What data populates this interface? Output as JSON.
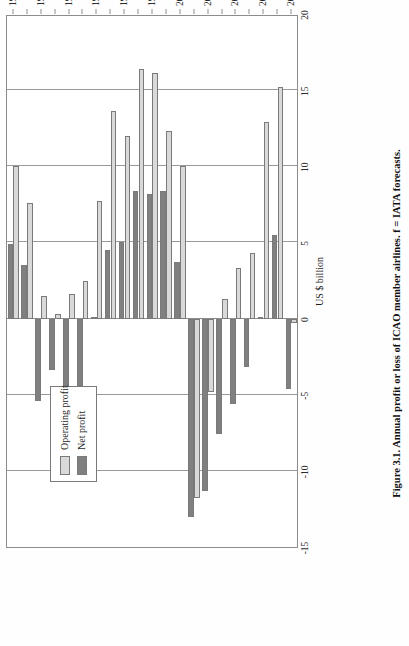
{
  "figure": {
    "caption": "Figure 3.1. Annual profit or loss of ICAO member airlines. f = IATA forecasts.",
    "page_orientation": "rotated-90"
  },
  "legend": {
    "position": "inside-upper-left",
    "items": [
      {
        "label": "Operating profit",
        "color": "#d9d9d9",
        "key": "op"
      },
      {
        "label": "Net profit",
        "color": "#808080",
        "key": "net"
      }
    ]
  },
  "axis": {
    "value_axis_title": "US $ billion",
    "value_ticks": [
      "20",
      "15",
      "10",
      "5",
      "0",
      "-5",
      "-10",
      "-15"
    ],
    "category_axis_title": ""
  },
  "chart_data": {
    "type": "bar",
    "orientation": "horizontal",
    "title": "Annual profit or loss of ICAO member airlines",
    "xlabel": "US $ billion",
    "ylabel": "",
    "xlim": [
      -15,
      20
    ],
    "grid": true,
    "legend_position": "upper-left-inside",
    "categories": [
      "1988",
      "1989",
      "1990",
      "1991",
      "1992",
      "1993",
      "1994",
      "1995",
      "1996",
      "1997",
      "1998",
      "1999",
      "2000",
      "2001",
      "2002",
      "2003",
      "2004",
      "2005",
      "2006",
      "2007",
      "2008f"
    ],
    "series": [
      {
        "name": "Operating profit",
        "color": "#d9d9d9",
        "values": [
          10.0,
          7.6,
          1.5,
          0.3,
          1.6,
          2.5,
          7.7,
          13.6,
          12.0,
          16.4,
          16.1,
          12.3,
          10.0,
          -11.8,
          -4.8,
          1.3,
          3.3,
          4.3,
          12.9,
          15.2,
          -0.3
        ]
      },
      {
        "name": "Net profit",
        "color": "#808080",
        "values": [
          4.9,
          3.5,
          -5.4,
          -3.4,
          -8.0,
          -4.4,
          0.0,
          4.5,
          5.0,
          8.4,
          8.2,
          8.4,
          3.7,
          -13.0,
          -11.3,
          -7.6,
          -5.6,
          -3.2,
          0.1,
          5.5,
          -4.6
        ]
      }
    ],
    "notes": "f = IATA forecast"
  }
}
